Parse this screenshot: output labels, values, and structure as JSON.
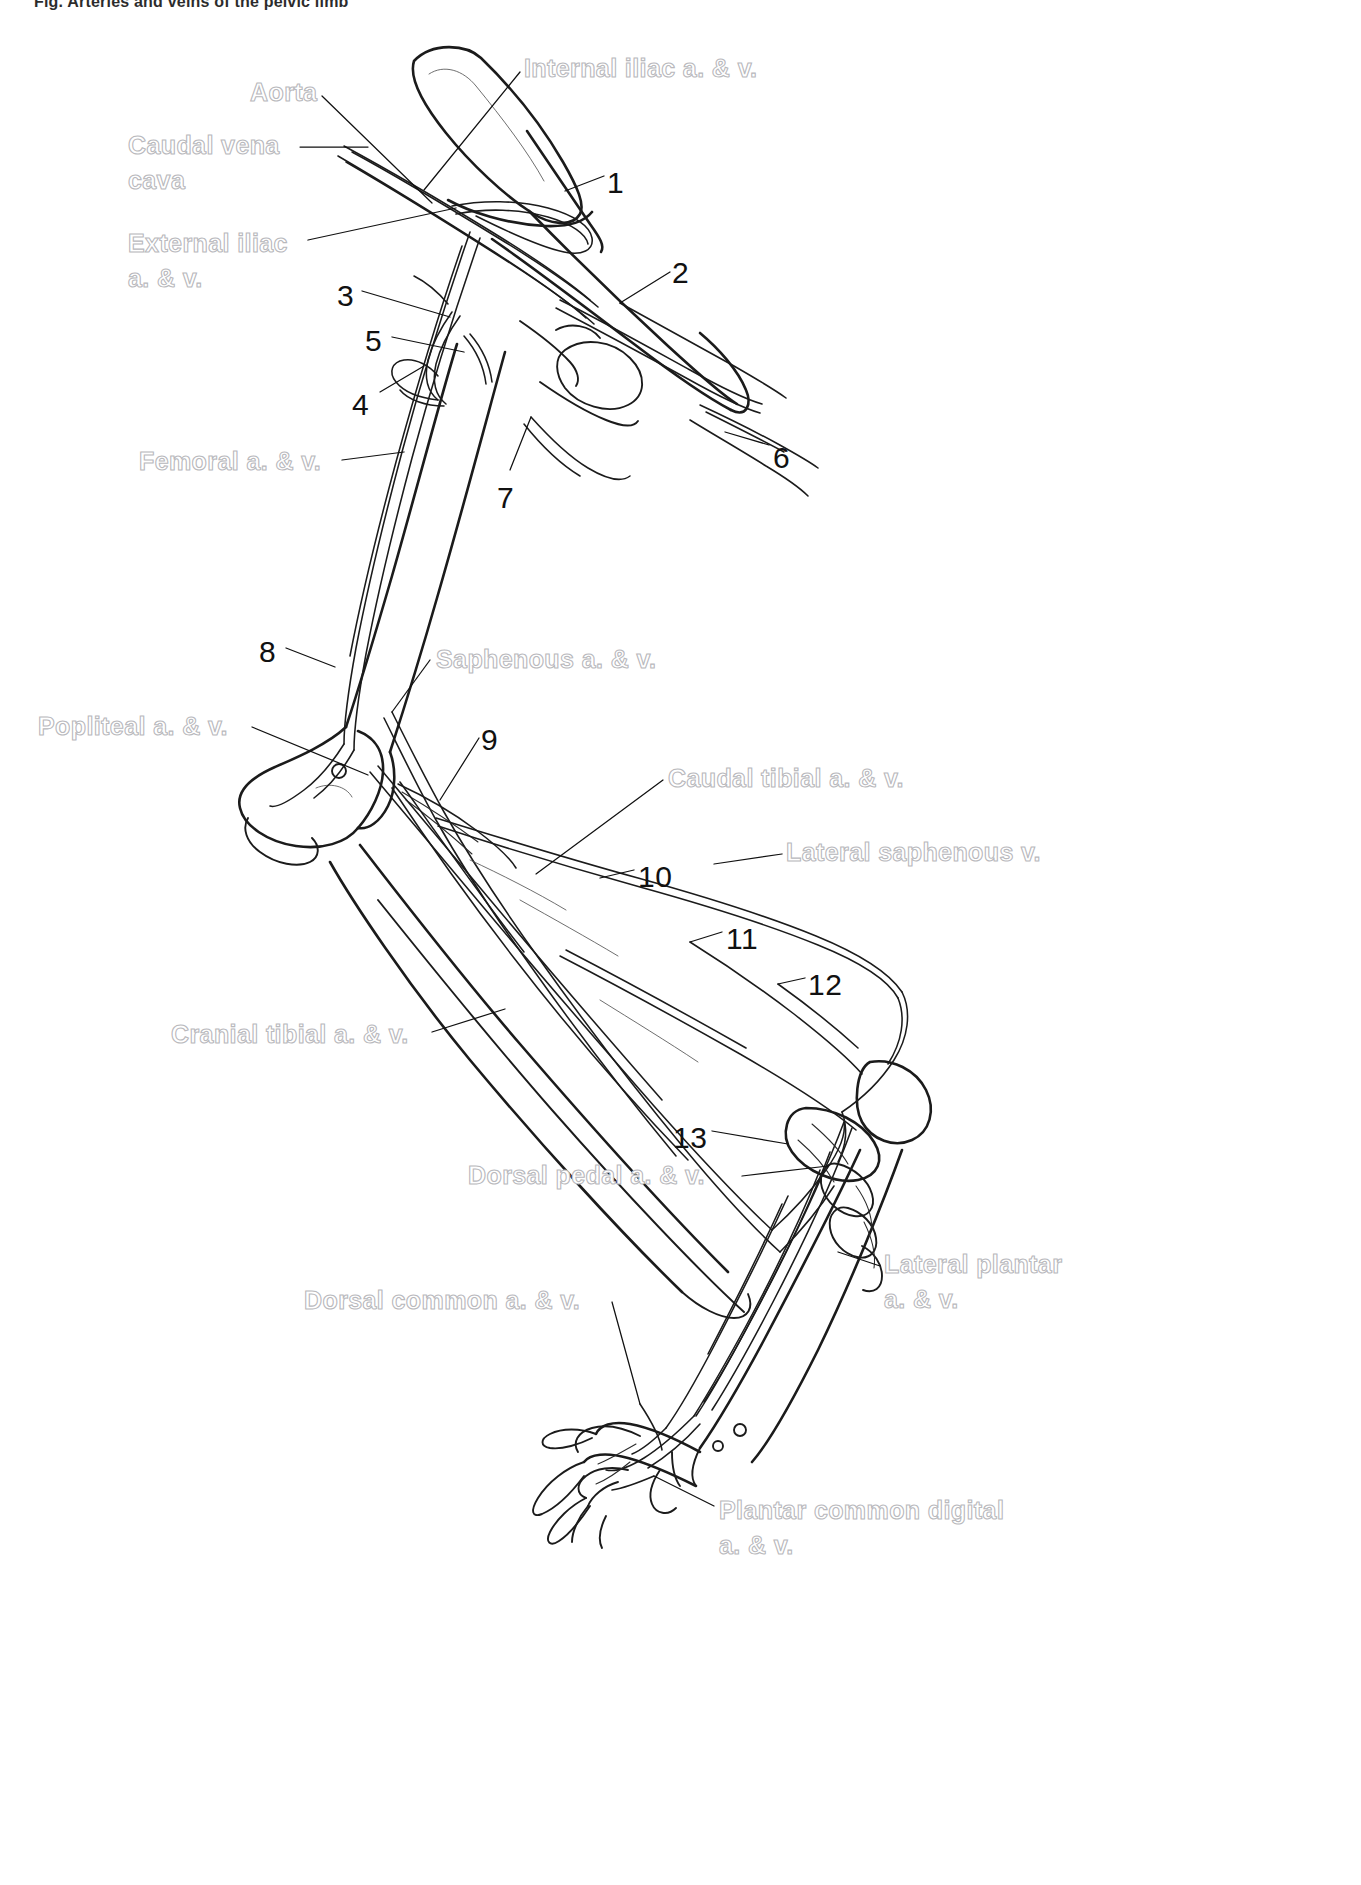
{
  "figure": {
    "caption": "Fig.  Arteries and veins of the pelvic limb"
  },
  "colors": {
    "ink": "#111111",
    "label_outline": "#b9b9bd",
    "background": "#ffffff"
  },
  "diagram": {
    "name_labels": [
      {
        "id": "aorta",
        "text": "Aorta",
        "x": 250,
        "y": 76,
        "align": "left"
      },
      {
        "id": "internal-iliac",
        "text": "Internal iliac a. & v.",
        "x": 524,
        "y": 52,
        "align": "left"
      },
      {
        "id": "caudal-vena-cava",
        "text": "Caudal vena\ncava",
        "x": 128,
        "y": 128,
        "align": "left"
      },
      {
        "id": "external-iliac",
        "text": "External iliac\na. & v.",
        "x": 128,
        "y": 226,
        "align": "left"
      },
      {
        "id": "femoral",
        "text": "Femoral a. & v.",
        "x": 139,
        "y": 445,
        "align": "left"
      },
      {
        "id": "saphenous",
        "text": "Saphenous a. & v.",
        "x": 436,
        "y": 643,
        "align": "left"
      },
      {
        "id": "popliteal",
        "text": "Popliteal a. & v.",
        "x": 38,
        "y": 710,
        "align": "left"
      },
      {
        "id": "caudal-tibial",
        "text": "Caudal tibial a. & v.",
        "x": 668,
        "y": 762,
        "align": "left"
      },
      {
        "id": "lateral-saphenous",
        "text": "Lateral saphenous v.",
        "x": 786,
        "y": 836,
        "align": "left"
      },
      {
        "id": "cranial-tibial",
        "text": "Cranial tibial a. & v.",
        "x": 171,
        "y": 1018,
        "align": "left"
      },
      {
        "id": "dorsal-pedal",
        "text": "Dorsal pedal a. & v.",
        "x": 468,
        "y": 1159,
        "align": "left"
      },
      {
        "id": "lateral-plantar",
        "text": "Lateral plantar\na. & v.",
        "x": 884,
        "y": 1247,
        "align": "left"
      },
      {
        "id": "dorsal-common",
        "text": "Dorsal common a. & v.",
        "x": 304,
        "y": 1284,
        "align": "left"
      },
      {
        "id": "plantar-common",
        "text": "Plantar common digital\na. & v.",
        "x": 719,
        "y": 1493,
        "align": "left"
      }
    ],
    "number_labels": [
      {
        "id": "1",
        "text": "1",
        "x": 607,
        "y": 163
      },
      {
        "id": "2",
        "text": "2",
        "x": 672,
        "y": 253
      },
      {
        "id": "3",
        "text": "3",
        "x": 337,
        "y": 276
      },
      {
        "id": "5",
        "text": "5",
        "x": 365,
        "y": 321
      },
      {
        "id": "4",
        "text": "4",
        "x": 352,
        "y": 385
      },
      {
        "id": "6",
        "text": "6",
        "x": 773,
        "y": 438
      },
      {
        "id": "7",
        "text": "7",
        "x": 497,
        "y": 478
      },
      {
        "id": "8",
        "text": "8",
        "x": 259,
        "y": 632
      },
      {
        "id": "9",
        "text": "9",
        "x": 481,
        "y": 720
      },
      {
        "id": "10",
        "text": "10",
        "x": 638,
        "y": 857
      },
      {
        "id": "11",
        "text": "11",
        "x": 726,
        "y": 919
      },
      {
        "id": "12",
        "text": "12",
        "x": 808,
        "y": 965
      },
      {
        "id": "13",
        "text": "13",
        "x": 673,
        "y": 1118
      }
    ],
    "leader_lines": [
      {
        "id": "aorta",
        "points": "322,96 432,203"
      },
      {
        "id": "internal-iliac",
        "points": "520,72 424,190"
      },
      {
        "id": "caudal-vena-cava",
        "points": "300,147 368,147"
      },
      {
        "id": "external-iliac",
        "points": "308,240 456,208"
      },
      {
        "id": "femoral",
        "points": "342,460 404,452"
      },
      {
        "id": "saphenous",
        "points": "430,660 392,712"
      },
      {
        "id": "popliteal",
        "points": "252,727 368,775"
      },
      {
        "id": "caudal-tibial",
        "points": "663,780 536,874"
      },
      {
        "id": "lateral-saphenous",
        "points": "782,854 714,864"
      },
      {
        "id": "cranial-tibial",
        "points": "432,1032 505,1009"
      },
      {
        "id": "dorsal-pedal",
        "points": "742,1176 828,1166"
      },
      {
        "id": "lateral-plantar",
        "points": "880,1266 838,1252"
      },
      {
        "id": "dorsal-common",
        "points": "612,1302 640,1404"
      },
      {
        "id": "plantar-common",
        "points": "714,1506 654,1476"
      },
      {
        "id": "n1",
        "points": "604,176 565,191"
      },
      {
        "id": "n2",
        "points": "670,272 620,303"
      },
      {
        "id": "n3",
        "points": "362,291 450,317"
      },
      {
        "id": "n5",
        "points": "392,337 464,352"
      },
      {
        "id": "n4",
        "points": "380,392 424,366"
      },
      {
        "id": "n6",
        "points": "769,445 725,432"
      },
      {
        "id": "n7",
        "points": "510,470 531,417"
      },
      {
        "id": "n8",
        "points": "286,648 335,667"
      },
      {
        "id": "n9",
        "points": "479,738 440,800"
      },
      {
        "id": "n10",
        "points": "634,870 600,878"
      },
      {
        "id": "n11",
        "points": "722,932 690,942"
      },
      {
        "id": "n12",
        "points": "805,978 778,984"
      },
      {
        "id": "n13",
        "points": "712,1131 788,1144"
      }
    ]
  }
}
